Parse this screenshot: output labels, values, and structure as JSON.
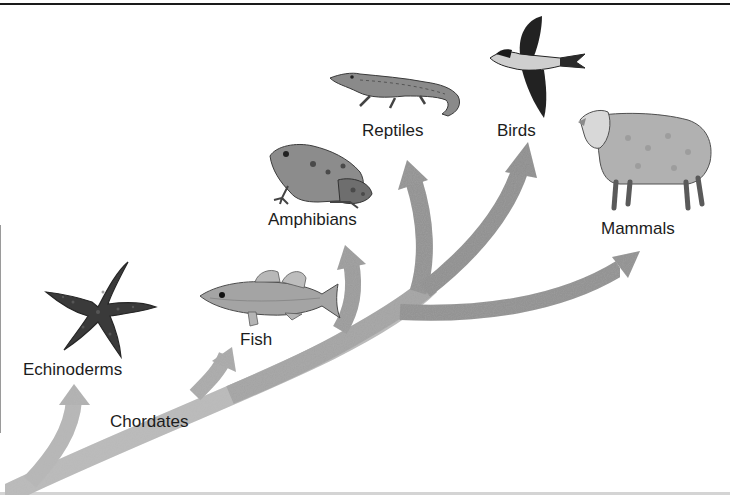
{
  "diagram": {
    "type": "evolutionary-tree",
    "arrow_color": "#8e8e8e",
    "root_label": "Chordates",
    "branches": [
      {
        "id": "echinoderms",
        "label": "Echinoderms",
        "image": "starfish"
      },
      {
        "id": "fish",
        "label": "Fish",
        "image": "fish"
      },
      {
        "id": "amphibians",
        "label": "Amphibians",
        "image": "frog"
      },
      {
        "id": "reptiles",
        "label": "Reptiles",
        "image": "alligator"
      },
      {
        "id": "birds",
        "label": "Birds",
        "image": "bird"
      },
      {
        "id": "mammals",
        "label": "Mammals",
        "image": "sheep"
      }
    ]
  }
}
